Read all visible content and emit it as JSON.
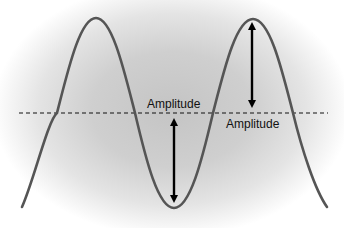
{
  "diagram": {
    "title": "",
    "type": "sine-wave-amplitude",
    "labels": {
      "amplitude_upper": "Amplitude",
      "amplitude_lower": "Amplitude"
    },
    "colors": {
      "wave": "#555555",
      "arrow": "#000000",
      "midline": "#111111",
      "background_center": "#c4c4c4",
      "background_edge": "#ffffff"
    },
    "geometry": {
      "midline_y": 113,
      "peaks": [
        [
          96,
          18
        ],
        [
          253,
          19
        ]
      ],
      "trough": [
        174,
        208
      ],
      "arrows": [
        {
          "name": "crest-amplitude",
          "x": 252,
          "from_y": 22,
          "to_y": 108
        },
        {
          "name": "trough-amplitude",
          "x": 174,
          "from_y": 118,
          "to_y": 203
        }
      ]
    }
  }
}
